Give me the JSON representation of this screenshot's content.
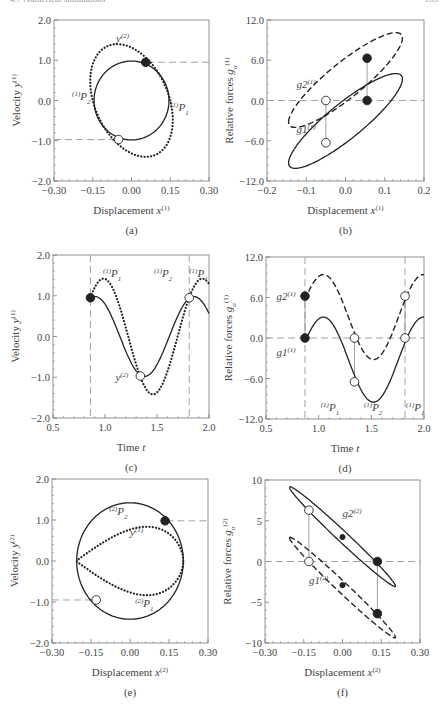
{
  "header": {
    "left": "4.7 Numerical simulations",
    "right": "165"
  },
  "chart_data": [
    {
      "id": "a",
      "type": "line",
      "caption": "(a)",
      "xlabel": "Displacement x(1)",
      "ylabel": "Velocity y(1)",
      "xlim": [
        -0.3,
        0.3
      ],
      "ylim": [
        -2.0,
        2.0
      ],
      "xticks": [
        "-0.30",
        "-0.15",
        "0.00",
        "0.15",
        "0.30"
      ],
      "yticks": [
        "-2.0",
        "-1.0",
        "0.0",
        "1.0",
        "2.0"
      ],
      "frame": [
        54,
        20,
        209,
        181
      ],
      "series": [
        {
          "name": "y(1) orbit",
          "style": "solid",
          "kind": "ellipse",
          "cx": 0.0,
          "cy": 0.0,
          "rx": 0.145,
          "ry": 0.98,
          "tilt": 0
        },
        {
          "name": "y(2)",
          "style": "dotted",
          "kind": "ellipse_skew",
          "cx": 0.0,
          "cy": 0.0,
          "rx": 0.15,
          "ry": 1.4,
          "skew": 0.055
        }
      ],
      "hlines": [
        {
          "y": 0.95,
          "x0": 0.06,
          "x1": 0.3
        },
        {
          "y": -0.97,
          "x0": -0.3,
          "x1": -0.05
        }
      ],
      "markers": [
        {
          "x": 0.055,
          "y": 0.95,
          "fill": "black"
        },
        {
          "x": -0.05,
          "y": -0.97,
          "fill": "white"
        }
      ],
      "annotations": [
        {
          "text": "y(2)",
          "x": -0.06,
          "y": 1.45
        },
        {
          "text": "(1)P2",
          "x": -0.23,
          "y": 0.02
        },
        {
          "text": "(1)P1",
          "x": 0.15,
          "y": -0.26
        }
      ]
    },
    {
      "id": "b",
      "type": "line",
      "caption": "(b)",
      "xlabel": "Displacement x(1)",
      "ylabel": "Relative forces gα(1)",
      "xlim": [
        -0.2,
        0.2
      ],
      "ylim": [
        -12.0,
        12.0
      ],
      "xticks": [
        "-0.2",
        "-0.1",
        "0.0",
        "0.1",
        "0.2"
      ],
      "yticks": [
        "-12.0",
        "-6.0",
        "0.0",
        "6.0",
        "12.0"
      ],
      "frame": [
        267,
        20,
        424,
        181
      ],
      "series": [
        {
          "name": "g2(1)",
          "style": "dashed",
          "kind": "hysteresis",
          "x0": -0.145,
          "y0": -3.2,
          "x1": 0.145,
          "y1": 9.3,
          "bulge": 3.3
        },
        {
          "name": "g1(1)",
          "style": "solid",
          "kind": "hysteresis",
          "x0": -0.145,
          "y0": -9.3,
          "x1": 0.145,
          "y1": 3.2,
          "bulge": 3.3
        }
      ],
      "hlines": [
        {
          "y": 0.0,
          "x0": -0.2,
          "x1": 0.2
        }
      ],
      "vconnect": [
        {
          "x": 0.055,
          "y0": 6.3,
          "y1": 0.0
        },
        {
          "x": -0.05,
          "y0": 0.0,
          "y1": -6.3
        }
      ],
      "markers": [
        {
          "x": 0.055,
          "y": 6.3,
          "fill": "black"
        },
        {
          "x": 0.055,
          "y": 0.0,
          "fill": "black"
        },
        {
          "x": -0.05,
          "y": 0.0,
          "fill": "white"
        },
        {
          "x": -0.05,
          "y": -6.3,
          "fill": "white"
        }
      ],
      "annotations": [
        {
          "text": "g2(1)",
          "x": -0.125,
          "y": 1.8
        },
        {
          "text": "g1(1)",
          "x": -0.125,
          "y": -4.8
        }
      ]
    },
    {
      "id": "c",
      "type": "line",
      "caption": "(c)",
      "xlabel": "Time t",
      "ylabel": "Velocity y(1)",
      "xlim": [
        0.5,
        2.0
      ],
      "ylim": [
        -2.0,
        2.0
      ],
      "xticks": [
        "0.5",
        "1.0",
        "1.5",
        "2.0"
      ],
      "yticks": [
        "-2.0",
        "-1.0",
        "0.0",
        "1.0",
        "2.0"
      ],
      "frame": [
        53,
        255,
        209,
        418
      ],
      "series": [
        {
          "name": "y(1)",
          "style": "solid",
          "kind": "sine",
          "amp": 0.98,
          "period": 0.95,
          "phase_t": 0.86,
          "phase0": 1.27,
          "t0": 0.86,
          "t1": 2.0
        },
        {
          "name": "y(2)",
          "style": "dotted",
          "kind": "sine",
          "amp": 1.42,
          "period": 0.95,
          "phase_t": 0.86,
          "phase0": 0.74,
          "t0": 0.86,
          "t1": 2.0
        }
      ],
      "vlines": [
        {
          "x": 0.86
        },
        {
          "x": 1.81
        }
      ],
      "markers": [
        {
          "x": 0.86,
          "y": 0.95,
          "fill": "black"
        },
        {
          "x": 1.34,
          "y": -0.97,
          "fill": "white"
        },
        {
          "x": 1.81,
          "y": 0.95,
          "fill": "white"
        }
      ],
      "annotations": [
        {
          "text": "(1)P1",
          "x": 0.98,
          "y": 1.45
        },
        {
          "text": "(1)P2",
          "x": 1.47,
          "y": 1.45
        },
        {
          "text": "(1)P1",
          "x": 1.81,
          "y": 1.45
        },
        {
          "text": "y(2)",
          "x": 1.1,
          "y": -1.1
        }
      ]
    },
    {
      "id": "d",
      "type": "line",
      "caption": "(d)",
      "xlabel": "Time t",
      "ylabel": "Relative forces gα(1)",
      "xlim": [
        0.5,
        2.0
      ],
      "ylim": [
        -12.0,
        12.0
      ],
      "xticks": [
        "0.5",
        "1.0",
        "1.5",
        "2.0"
      ],
      "yticks": [
        "-12.0",
        "-6.0",
        "0.0",
        "6.0",
        "12.0"
      ],
      "frame": [
        266,
        257,
        424,
        419
      ],
      "series": [
        {
          "name": "g2(1)",
          "style": "dashed",
          "kind": "sine",
          "amp": 6.3,
          "offset": 3.1,
          "period": 0.95,
          "phase_t": 1.045,
          "phase0": 1.5708,
          "t0": 0.87,
          "t1": 2.0
        },
        {
          "name": "g1(1)",
          "style": "solid",
          "kind": "sine",
          "amp": 6.3,
          "offset": -3.2,
          "period": 0.95,
          "phase_t": 1.045,
          "phase0": 1.5708,
          "t0": 0.87,
          "t1": 2.0
        }
      ],
      "hlines": [
        {
          "y": 0.0,
          "x0": 0.5,
          "x1": 2.0
        }
      ],
      "vlines": [
        {
          "x": 0.87
        },
        {
          "x": 1.82
        }
      ],
      "vconnect": [
        {
          "x": 0.87,
          "y0": 6.2,
          "y1": 0.0
        },
        {
          "x": 1.34,
          "y0": 0.0,
          "y1": -6.5
        },
        {
          "x": 1.82,
          "y0": 6.2,
          "y1": 0.0
        }
      ],
      "markers": [
        {
          "x": 0.87,
          "y": 6.2,
          "fill": "black"
        },
        {
          "x": 0.87,
          "y": 0.0,
          "fill": "black"
        },
        {
          "x": 1.34,
          "y": 0.0,
          "fill": "white"
        },
        {
          "x": 1.34,
          "y": -6.5,
          "fill": "white"
        },
        {
          "x": 1.82,
          "y": 6.2,
          "fill": "white"
        },
        {
          "x": 1.82,
          "y": 0.0,
          "fill": "white"
        }
      ],
      "annotations": [
        {
          "text": "g2(1)",
          "x": 0.6,
          "y": 5.6
        },
        {
          "text": "g1(1)",
          "x": 0.6,
          "y": -2.6
        },
        {
          "text": "(1)P1",
          "x": 1.02,
          "y": -10.8
        },
        {
          "text": "(1)P2",
          "x": 1.43,
          "y": -10.8
        },
        {
          "text": "(1)P1",
          "x": 1.83,
          "y": -10.8
        }
      ]
    },
    {
      "id": "e",
      "type": "line",
      "caption": "(e)",
      "xlabel": "Displacement x(2)",
      "ylabel": "Velocity y(2)",
      "xlim": [
        -0.3,
        0.3
      ],
      "ylim": [
        -2.0,
        2.0
      ],
      "xticks": [
        "-0.30",
        "-0.15",
        "0.00",
        "0.15",
        "0.30"
      ],
      "yticks": [
        "-2.0",
        "-1.0",
        "0.0",
        "1.0",
        "2.0"
      ],
      "frame": [
        52,
        479,
        208,
        643
      ],
      "series": [
        {
          "name": "y(2) orbit",
          "style": "solid",
          "kind": "ellipse",
          "cx": 0.0,
          "cy": 0.0,
          "rx": 0.205,
          "ry": 1.42,
          "tilt": 0
        },
        {
          "name": "y(1)",
          "style": "dotted",
          "kind": "lens",
          "x0": -0.205,
          "x1": 0.205,
          "ry": 0.98,
          "skew": 0.135
        }
      ],
      "hlines": [
        {
          "y": 0.98,
          "x0": 0.14,
          "x1": 0.3
        },
        {
          "y": -0.95,
          "x0": -0.3,
          "x1": -0.13
        }
      ],
      "markers": [
        {
          "x": 0.135,
          "y": 0.98,
          "fill": "black"
        },
        {
          "x": -0.13,
          "y": -0.95,
          "fill": "white"
        }
      ],
      "annotations": [
        {
          "text": "(2)P2",
          "x": -0.08,
          "y": 1.12
        },
        {
          "text": "y(1)",
          "x": 0.0,
          "y": 0.6
        },
        {
          "text": "(2)P1",
          "x": 0.02,
          "y": -1.12
        }
      ]
    },
    {
      "id": "f",
      "type": "line",
      "caption": "(f)",
      "xlabel": "Displacement x(2)",
      "ylabel": "Relative forces gα(2)",
      "xlim": [
        -0.3,
        0.3
      ],
      "ylim": [
        -10,
        10
      ],
      "xticks": [
        "-0.30",
        "-0.15",
        "0.00",
        "0.15",
        "0.30"
      ],
      "yticks": [
        "-10",
        "-5",
        "0",
        "5",
        "10"
      ],
      "frame": [
        265,
        480,
        420,
        643
      ],
      "series": [
        {
          "name": "g2(2)",
          "style": "solid",
          "kind": "hysteresis",
          "x0": -0.205,
          "y0": 9.1,
          "x1": 0.205,
          "y1": -3.0,
          "bulge": 0.9
        },
        {
          "name": "g1(2)",
          "style": "dashed",
          "kind": "hysteresis",
          "x0": -0.205,
          "y0": 2.9,
          "x1": 0.205,
          "y1": -9.3,
          "bulge": 0.9
        }
      ],
      "hlines": [
        {
          "y": 0.0,
          "x0": -0.3,
          "x1": 0.3
        }
      ],
      "vconnect": [
        {
          "x": -0.13,
          "y0": 6.3,
          "y1": 0.0
        },
        {
          "x": 0.135,
          "y0": 0.0,
          "y1": -6.4
        }
      ],
      "markers": [
        {
          "x": -0.13,
          "y": 6.3,
          "fill": "white"
        },
        {
          "x": -0.13,
          "y": 0.0,
          "fill": "white"
        },
        {
          "x": 0.135,
          "y": 0.0,
          "fill": "black"
        },
        {
          "x": 0.135,
          "y": -6.4,
          "fill": "black"
        },
        {
          "x": 0.0,
          "y": 3.0,
          "fill": "black",
          "small": true
        },
        {
          "x": 0.0,
          "y": -2.9,
          "fill": "black",
          "small": true
        }
      ],
      "annotations": [
        {
          "text": "g2(2)",
          "x": 0.0,
          "y": 5.5
        },
        {
          "text": "g1(2)",
          "x": -0.13,
          "y": -2.7
        }
      ]
    }
  ]
}
